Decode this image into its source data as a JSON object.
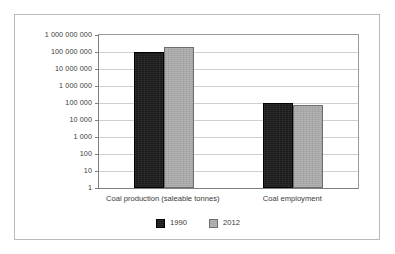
{
  "chart_data": {
    "type": "bar",
    "title": "",
    "subtitle": "",
    "xlabel": "",
    "ylabel": "",
    "categories": [
      "Coal production (saleable tonnes)",
      "Coal employment"
    ],
    "series": [
      {
        "name": "1990",
        "color": "#1a1a1a",
        "values": [
          100000000,
          100000
        ]
      },
      {
        "name": "2012",
        "color": "#a8a8a8",
        "values": [
          200000000,
          75000
        ]
      }
    ],
    "yscale": "log",
    "ylim": [
      1,
      1000000000
    ],
    "yticks": [
      1,
      10,
      100,
      1000,
      10000,
      100000,
      1000000,
      10000000,
      100000000,
      1000000000
    ],
    "ytick_labels": [
      "1",
      "10",
      "100",
      "1 000",
      "10 000",
      "100 000",
      "1 000 000",
      "10 000 000",
      "100 000 000",
      "1 000 000 000"
    ],
    "grid": true,
    "grid_axis": "y",
    "legend_position": "bottom",
    "legend": [
      "1990",
      "2012"
    ],
    "annotations": []
  },
  "style": {
    "frame_border_color": "#b9b9b9",
    "gridline_color": "#cfcfcf",
    "axis_color": "#7f7f7f",
    "text_color": "#3a3a3a",
    "background": "#ffffff"
  }
}
